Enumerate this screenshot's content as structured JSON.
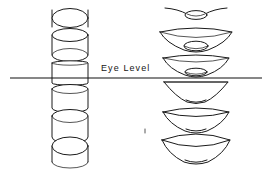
{
  "diagram": {
    "horizon": {
      "label": "Eye  Level",
      "label_x": 101,
      "label_y": 70,
      "line_x1": 10,
      "line_x2": 262,
      "line_y": 78,
      "color": "#111111"
    },
    "stroke_color": "#1a1a1a",
    "background": "#ffffff",
    "columns": [
      {
        "name": "cylinder-column",
        "center_x": 70,
        "object_type": "cylinder",
        "items": [
          {
            "name": "cylinder-1",
            "position": "far-above-eye-level",
            "center_y": 17,
            "rim_open": "top-ellipse-wide",
            "ellipse_ry": 9.5,
            "body_height": 14
          },
          {
            "name": "cylinder-2",
            "position": "above-eye-level",
            "center_y": 45,
            "rim_open": "top-ellipse-medium",
            "ellipse_ry": 6.5,
            "body_height": 20
          },
          {
            "name": "cylinder-3",
            "position": "at-eye-level",
            "center_y": 72,
            "rim_open": "top-ellipse-flat",
            "ellipse_ry": 1.5,
            "body_height": 22
          },
          {
            "name": "cylinder-4",
            "position": "below-eye-level",
            "center_y": 98,
            "rim_open": "bottom-ellipse-narrow",
            "ellipse_ry": 4.0,
            "body_height": 20
          },
          {
            "name": "cylinder-5",
            "position": "further-below-eye-level",
            "center_y": 126,
            "rim_open": "bottom-ellipse-medium",
            "ellipse_ry": 6.5,
            "body_height": 22
          },
          {
            "name": "cylinder-6",
            "position": "far-below-eye-level",
            "center_y": 154,
            "rim_open": "bottom-ellipse-wide",
            "ellipse_ry": 9.0,
            "body_height": 18
          }
        ]
      },
      {
        "name": "cone-column",
        "center_x": 196,
        "object_type": "cone",
        "items": [
          {
            "name": "cone-1",
            "position": "far-above-eye-level",
            "center_y": 12,
            "top_rx": 32,
            "top_ry": 1.5,
            "base_rx": 11,
            "base_ry": 4.0,
            "depth": 9
          },
          {
            "name": "cone-2",
            "position": "above-eye-level",
            "center_y": 38,
            "top_rx": 36,
            "top_ry": 5.5,
            "base_rx": 12,
            "base_ry": 4.5,
            "depth": 17
          },
          {
            "name": "cone-3",
            "position": "near-eye-level",
            "center_y": 63,
            "top_rx": 33,
            "top_ry": 4.0,
            "base_rx": 11,
            "base_ry": 3.5,
            "depth": 17
          },
          {
            "name": "cone-4",
            "position": "at-eye-level",
            "center_y": 88,
            "top_rx": 32,
            "top_ry": 1.0,
            "base_rx": 10,
            "base_ry": 2.0,
            "depth": 19
          },
          {
            "name": "cone-5",
            "position": "below-eye-level",
            "center_y": 117,
            "top_rx": 33,
            "top_ry": 7.0,
            "base_rx": 11,
            "base_ry": 3.0,
            "depth": 22
          },
          {
            "name": "cone-6",
            "position": "far-below-eye-level",
            "center_y": 148,
            "top_rx": 34,
            "top_ry": 10.0,
            "base_rx": 12,
            "base_ry": 3.5,
            "depth": 24
          }
        ]
      }
    ],
    "caption_marks": [
      {
        "name": "stray-tick-mark",
        "x": 145,
        "y": 131
      }
    ]
  }
}
